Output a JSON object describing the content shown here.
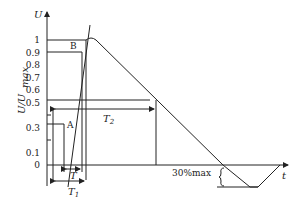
{
  "diagram": {
    "y_axis_label": "U",
    "y_axis_ratio_label_main": "U/U",
    "y_axis_ratio_label_sub": "max",
    "x_axis_label": "t",
    "y_ticks": [
      "1",
      "0.9",
      "0.8",
      "0.7",
      "0.6",
      "0.5",
      "0.3",
      "0.1",
      "0"
    ],
    "tick_values": [
      1,
      0.9,
      0.8,
      0.7,
      0.6,
      0.5,
      0.3,
      0.1,
      0
    ],
    "point_a": "A",
    "point_b": "B",
    "t1_label": "T",
    "t1_sub": "1",
    "t2_label": "T",
    "t2_sub": "2",
    "t_label": "T",
    "undershoot_label": "30%max"
  }
}
